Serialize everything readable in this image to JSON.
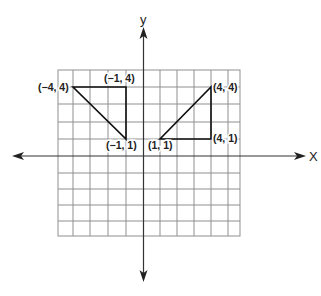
{
  "axes": {
    "x_label": "X",
    "y_label": "y"
  },
  "grid": {
    "x_lines": [
      58,
      73,
      90,
      108,
      126,
      143.5,
      160,
      177,
      194,
      211,
      228,
      240
    ],
    "y_lines": [
      70,
      87,
      104,
      122,
      139,
      156,
      173,
      189,
      205,
      221,
      236
    ],
    "left": 58,
    "right": 240,
    "top": 70,
    "bottom": 236
  },
  "triangles": [
    {
      "name": "left-triangle",
      "vertices": [
        {
          "label": "(−4, 4)",
          "x": -4,
          "y": 4
        },
        {
          "label": "(−1, 4)",
          "x": -1,
          "y": 4
        },
        {
          "label": "(−1, 1)",
          "x": -1,
          "y": 1
        }
      ]
    },
    {
      "name": "right-triangle",
      "vertices": [
        {
          "label": "(4, 4)",
          "x": 4,
          "y": 4
        },
        {
          "label": "(4, 1)",
          "x": 4,
          "y": 1
        },
        {
          "label": "(1, 1)",
          "x": 1,
          "y": 1
        }
      ]
    }
  ],
  "labels": {
    "p_m4_4": "(−4, 4)",
    "p_m1_4": "(−1, 4)",
    "p_m1_1": "(−1, 1)",
    "p_1_1": "(1, 1)",
    "p_4_4": "(4, 4)",
    "p_4_1": "(4, 1)"
  },
  "colors": {
    "grid": "#8a8a8a",
    "axis": "#333333",
    "shape": "#111111"
  }
}
